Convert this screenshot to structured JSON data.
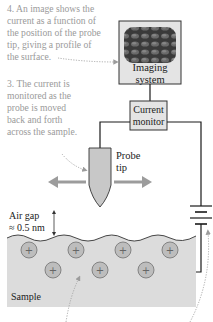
{
  "captions": {
    "step4": "4. An image shows the\ncurrent as a function of\nthe position of the probe\ntip, giving a profile of\nthe surface.",
    "step3": "3. The current is\nmonitored as the\nprobe is moved\nback and forth\nacross the sample."
  },
  "components": {
    "imaging_system": "Imaging\nsystem",
    "current_monitor": "Current\nmonitor",
    "probe_tip": "Probe\ntip",
    "air_gap": "Air gap\n≈ 0.5 nm",
    "sample": "Sample"
  },
  "ions": {
    "symbol": "+",
    "count": 7
  },
  "colors": {
    "caption_text": "#9a9a9a",
    "box_fill": "#e4e4e4",
    "sample_fill": "#dcdcdc",
    "ion_fill": "#bdbdbd",
    "probe_fill": "#c8c8c8",
    "arrow": "#9c9c9c",
    "wire": "#1a1a1a"
  }
}
